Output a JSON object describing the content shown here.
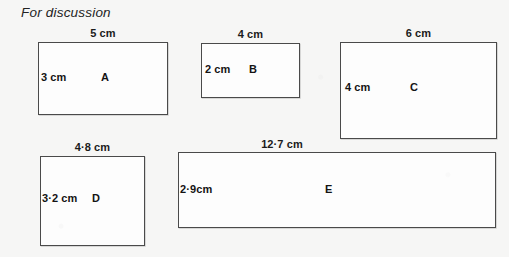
{
  "heading": "For discussion",
  "colors": {
    "page_background": "#f6f6f5",
    "shape_fill": "#fdfdfd",
    "shape_outline": "#4a4a4a",
    "text": "#141414"
  },
  "shapes": [
    {
      "id": "A",
      "name_label": "A",
      "width_label": "5 cm",
      "height_label": "3 cm"
    },
    {
      "id": "B",
      "name_label": "B",
      "width_label": "4 cm",
      "height_label": "2 cm"
    },
    {
      "id": "C",
      "name_label": "C",
      "width_label": "6 cm",
      "height_label": "4 cm"
    },
    {
      "id": "D",
      "name_label": "D",
      "width_label": "4·8 cm",
      "height_label": "3·2 cm"
    },
    {
      "id": "E",
      "name_label": "E",
      "width_label": "12·7 cm",
      "height_label": "2·9cm"
    }
  ]
}
